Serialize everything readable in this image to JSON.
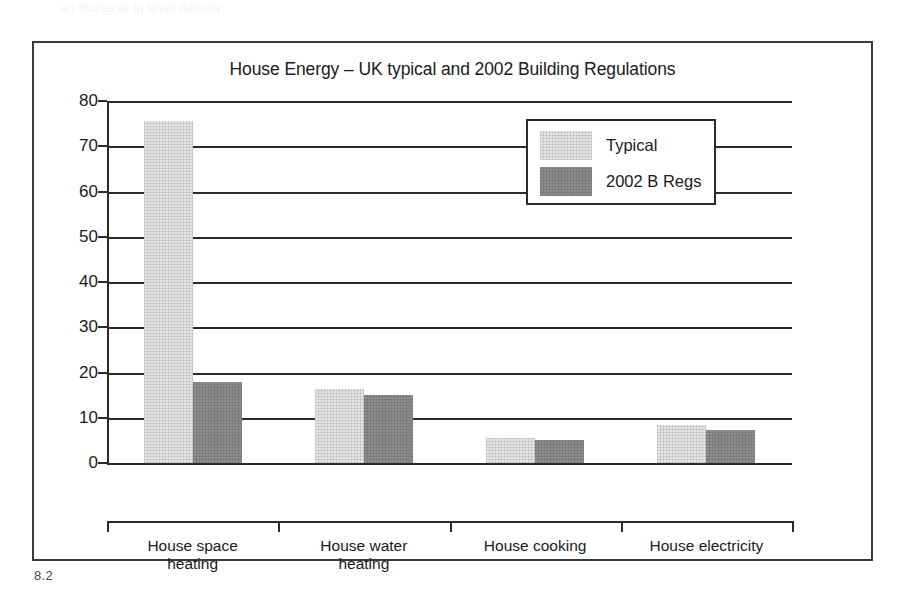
{
  "page": {
    "top_text_fragment": "an increase in level density",
    "figure_caption": "8.2"
  },
  "chart_data": {
    "type": "bar",
    "title": "House Energy – UK typical and 2002 Building Regulations",
    "xlabel": "GJ/Year",
    "ylabel": "",
    "categories": [
      "House space\nheating",
      "House water\nheating",
      "House cooking",
      "House electricity"
    ],
    "categories_display": [
      [
        "House space",
        "heating"
      ],
      [
        "House water",
        "heating"
      ],
      [
        "House cooking",
        ""
      ],
      [
        "House electricity",
        ""
      ]
    ],
    "series": [
      {
        "name": "Typical",
        "color": "#e6e6e6",
        "values": [
          75.5,
          16.3,
          5.5,
          8.5
        ]
      },
      {
        "name": "2002 B Regs",
        "color": "#8d8d8d",
        "values": [
          18.0,
          15.0,
          5.0,
          7.3
        ]
      }
    ],
    "ylim": [
      0,
      80
    ],
    "yticks": [
      0,
      10,
      20,
      30,
      40,
      50,
      60,
      70,
      80
    ],
    "ytick_labels": [
      "0",
      "10",
      "20",
      "30",
      "40",
      "50",
      "60",
      "70",
      "80"
    ],
    "grid": true,
    "legend_position": "upper-right"
  }
}
